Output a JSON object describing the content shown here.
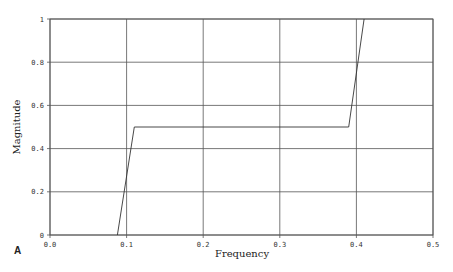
{
  "chart_data": {
    "type": "line",
    "title": "",
    "panel_label": "A",
    "xlabel": "Frequency",
    "ylabel": "Magnitude",
    "xlim": [
      0.0,
      0.5
    ],
    "ylim": [
      0,
      1
    ],
    "xticks": [
      0.0,
      0.1,
      0.2,
      0.3,
      0.4,
      0.5
    ],
    "xtick_labels": [
      "0.0",
      "0.1",
      "0.2",
      "0.3",
      "0.4",
      "0.5"
    ],
    "yticks": [
      0,
      0.2,
      0.4,
      0.6,
      0.8,
      1
    ],
    "ytick_labels": [
      "0",
      "0.2",
      "0.4",
      "0.6",
      "0.8",
      "1"
    ],
    "grid": true,
    "legend": null,
    "series": [
      {
        "name": "magnitude response",
        "color": "#333333",
        "x": [
          0.088,
          0.11,
          0.39,
          0.41
        ],
        "y": [
          0,
          0.5,
          0.5,
          1.0
        ]
      }
    ]
  },
  "colors": {
    "grid": "#555555",
    "axis": "#555555",
    "line": "#333333",
    "background": "#ffffff"
  }
}
